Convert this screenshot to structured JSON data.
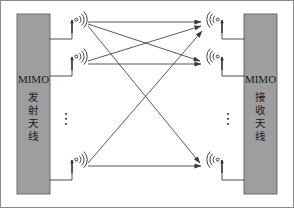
{
  "figure": {
    "background": "#ffffff",
    "width": 294,
    "height": 208
  },
  "colors": {
    "block_fill": "#9e9e9e",
    "block_stroke": "#6b6b6b",
    "line": "#3a3a3a",
    "text": "#1a1a1a",
    "border": "#8a8a8a"
  },
  "blocks": {
    "transmitter": {
      "name": "MIMO transmit antenna block",
      "latin_label": "MIMO",
      "cjk_chars": [
        "发",
        "射",
        "天",
        "线"
      ],
      "full_label": "MIMO 发射天线"
    },
    "receiver": {
      "name": "MIMO receive antenna block",
      "latin_label": "MIMO",
      "cjk_chars": [
        "接",
        "收",
        "天",
        "线"
      ],
      "full_label": "MIMO 接收天线"
    }
  },
  "ellipsis": {
    "glyph": "⋮",
    "left_label": "transmit-antenna-ellipsis",
    "right_label": "receive-antenna-ellipsis"
  },
  "antennas": {
    "transmit": [
      {
        "id": "tx-1",
        "label": "transmit antenna 1",
        "x": 76,
        "y": 26
      },
      {
        "id": "tx-2",
        "label": "transmit antenna 2",
        "x": 76,
        "y": 63
      },
      {
        "id": "tx-3",
        "label": "transmit antenna 3",
        "x": 76,
        "y": 166
      }
    ],
    "receive": [
      {
        "id": "rx-1",
        "label": "receive antenna 1",
        "x": 215,
        "y": 26
      },
      {
        "id": "rx-2",
        "label": "receive antenna 2",
        "x": 215,
        "y": 63
      },
      {
        "id": "rx-3",
        "label": "receive antenna 3",
        "x": 215,
        "y": 166
      }
    ]
  },
  "channel_paths": [
    {
      "id": "h11",
      "from": "tx-1",
      "to": "rx-1",
      "label": "tx1-to-rx1-path"
    },
    {
      "id": "h12",
      "from": "tx-1",
      "to": "rx-2",
      "label": "tx1-to-rx2-path"
    },
    {
      "id": "h13",
      "from": "tx-1",
      "to": "rx-3",
      "label": "tx1-to-rx3-path"
    },
    {
      "id": "h21",
      "from": "tx-2",
      "to": "rx-1",
      "label": "tx2-to-rx1-path"
    },
    {
      "id": "h22",
      "from": "tx-2",
      "to": "rx-2",
      "label": "tx2-to-rx2-path"
    },
    {
      "id": "h31",
      "from": "tx-3",
      "to": "rx-1",
      "label": "tx3-to-rx1-path"
    },
    {
      "id": "h33",
      "from": "tx-3",
      "to": "rx-3",
      "label": "tx3-to-rx3-path"
    }
  ]
}
